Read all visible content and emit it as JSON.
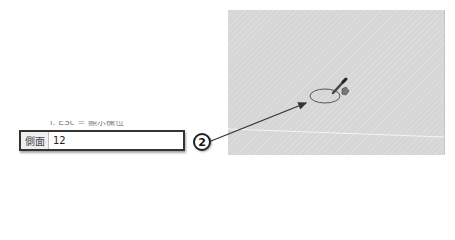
{
  "viewport": {
    "background_color": "#d6d6d6",
    "tool": "circle-tool-pencil-cursor"
  },
  "partial_text": "ⅰ. ESc = 顯示欄位",
  "measurements_box": {
    "label": "側面",
    "value": "12"
  },
  "callout": {
    "number": "2",
    "color": "#222222"
  }
}
